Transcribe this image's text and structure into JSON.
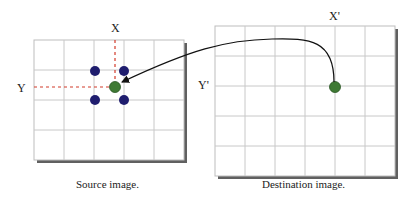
{
  "source": {
    "caption": "Source image.",
    "x_label": "X",
    "y_label": "Y",
    "grid": {
      "cols": 5,
      "rows": 4
    },
    "neighbor_points": 4,
    "neighbor_color": "#1f1d6e",
    "target_point_color": "#3f7a34"
  },
  "destination": {
    "caption": "Destination image.",
    "x_label": "X'",
    "y_label": "Y'",
    "grid": {
      "cols": 6,
      "rows": 5
    },
    "point_color": "#3f7a34"
  },
  "colors": {
    "grid_line": "#c8c8c8",
    "guide_dash": "#d23a2a",
    "arrow": "#111111",
    "shadow": "#444444"
  }
}
